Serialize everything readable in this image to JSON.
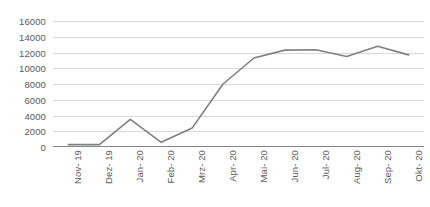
{
  "chart_data": {
    "type": "line",
    "title": "",
    "subtitle": "",
    "xlabel": "",
    "ylabel": "",
    "categories": [
      "Nov- 19",
      "Dez- 19",
      "Jan- 20",
      "Feb- 20",
      "Mrz- 20",
      "Apr- 20",
      "Mai- 20",
      "Jun- 20",
      "Jul- 20",
      "Aug- 20",
      "Sep- 20",
      "Okt- 20"
    ],
    "values": [
      300,
      300,
      3500,
      600,
      2400,
      8000,
      11300,
      12300,
      12350,
      11500,
      12800,
      11700
    ],
    "series": [
      {
        "name": "Serie 1",
        "values": [
          300,
          300,
          3500,
          600,
          2400,
          8000,
          11300,
          12300,
          12350,
          11500,
          12800,
          11700
        ]
      }
    ],
    "ylim": [
      0,
      16000
    ],
    "ytick_values": [
      16000,
      14000,
      12000,
      10000,
      8000,
      6000,
      4000,
      2000,
      0
    ],
    "ytick_labels": [
      "16000",
      "14000",
      "12000",
      "10000",
      "8000",
      "6000",
      "4000",
      "2000",
      "0"
    ],
    "grid": "horizontal",
    "legend": "none",
    "line_color": "#808080",
    "gridline_color": "#d9d9d9",
    "axis_color": "#868686",
    "tick_label_color": "#5a5a5a",
    "x_label_rotation": "-90"
  }
}
